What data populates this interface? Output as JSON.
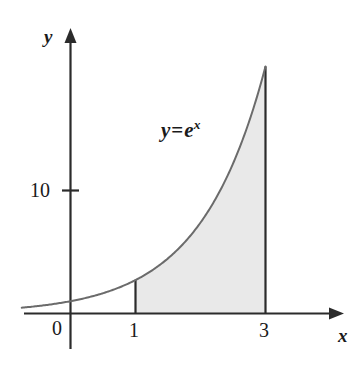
{
  "figure": {
    "kind": "math-figure",
    "background_color": "#ffffff",
    "axis_color": "#2b2b2b",
    "curve_color": "#6b6b6b",
    "shade_color": "#e9e9e9",
    "shade_edge_color": "#2b2b2b",
    "text_color": "#1a1a1a"
  },
  "labels": {
    "y_axis": "y",
    "x_axis": "x",
    "origin": "0",
    "y_tick_10": "10",
    "x_tick_1": "1",
    "x_tick_3": "3",
    "curve_equation_lhs": "y",
    "curve_equation_eq": "=",
    "curve_equation_base": "e",
    "curve_equation_exponent": "x"
  },
  "chart_data": {
    "type": "line",
    "title": "",
    "xlabel": "x",
    "ylabel": "y",
    "legend": [],
    "grid": false,
    "series": [
      {
        "name": "y = e^x",
        "expression": "exp(x)",
        "x": [
          -0.75,
          -0.5,
          -0.25,
          0,
          0.25,
          0.5,
          0.75,
          1,
          1.25,
          1.5,
          1.75,
          2,
          2.25,
          2.5,
          2.75,
          3
        ],
        "values": [
          0.47,
          0.61,
          0.78,
          1,
          1.28,
          1.65,
          2.12,
          2.72,
          3.49,
          4.48,
          5.75,
          7.39,
          9.49,
          12.18,
          15.64,
          20.09
        ]
      }
    ],
    "xlim": [
      -0.75,
      4.2
    ],
    "ylim": [
      0,
      21.5
    ],
    "xticks": [
      0,
      1,
      3
    ],
    "xticklabels": [
      "0",
      "1",
      "3"
    ],
    "yticks": [
      10
    ],
    "yticklabels": [
      "10"
    ],
    "shaded_region": {
      "label": "area under y = e^x",
      "x_from": 1,
      "x_to": 3,
      "y_from": 0,
      "fill": "#e9e9e9",
      "area_value": 17.367
    },
    "annotations": [
      {
        "text": "y = e^x",
        "x": 1.45,
        "y": 14.2
      }
    ],
    "vertical_rules": [
      {
        "x": 1,
        "y_top": 2.718
      },
      {
        "x": 3,
        "y_top": 20.086
      }
    ]
  }
}
